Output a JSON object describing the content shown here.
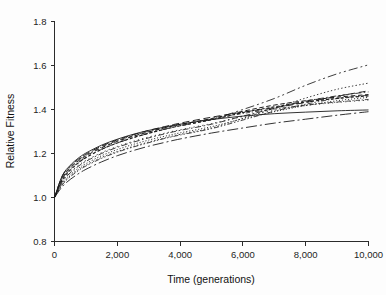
{
  "chart_data": {
    "type": "line",
    "title": "",
    "xlabel": "Time (generations)",
    "ylabel": "Relative Fitness",
    "xlim": [
      0,
      10000
    ],
    "ylim": [
      0.8,
      1.8
    ],
    "grid": false,
    "legend": "none",
    "xticks": [
      0,
      2000,
      4000,
      6000,
      8000,
      10000
    ],
    "xtick_labels": [
      "0",
      "2,000",
      "4,000",
      "6,000",
      "8,000",
      "10,000"
    ],
    "yticks": [
      0.8,
      1.0,
      1.2,
      1.4,
      1.6,
      1.8
    ],
    "ytick_labels": [
      "0.8",
      "1.0",
      "1.2",
      "1.4",
      "1.6",
      "1.8"
    ],
    "x": [
      0,
      250,
      500,
      750,
      1000,
      1500,
      2000,
      2500,
      3000,
      3500,
      4000,
      5000,
      6000,
      7000,
      8000,
      9000,
      10000
    ],
    "series": [
      {
        "name": "population-1",
        "style": "dashdotdot",
        "dash": "9,3,2,3,2,3",
        "width": 0.85,
        "values": [
          1.0,
          1.085,
          1.128,
          1.158,
          1.182,
          1.219,
          1.248,
          1.271,
          1.292,
          1.31,
          1.326,
          1.355,
          1.4,
          1.45,
          1.51,
          1.562,
          1.603
        ]
      },
      {
        "name": "population-2",
        "style": "dotted",
        "dash": "1.4,2.2",
        "width": 0.85,
        "values": [
          1.0,
          1.062,
          1.098,
          1.125,
          1.147,
          1.182,
          1.209,
          1.232,
          1.252,
          1.27,
          1.287,
          1.316,
          1.36,
          1.406,
          1.452,
          1.492,
          1.52
        ]
      },
      {
        "name": "population-3",
        "style": "dashed-long",
        "dash": "7,3.5",
        "width": 0.95,
        "values": [
          1.0,
          1.098,
          1.142,
          1.173,
          1.197,
          1.234,
          1.262,
          1.285,
          1.305,
          1.322,
          1.338,
          1.365,
          1.388,
          1.408,
          1.432,
          1.46,
          1.485
        ]
      },
      {
        "name": "population-4",
        "style": "dashdot",
        "dash": "6,2.5,1.6,2.5",
        "width": 0.85,
        "values": [
          1.0,
          1.072,
          1.112,
          1.141,
          1.164,
          1.2,
          1.228,
          1.251,
          1.271,
          1.289,
          1.305,
          1.333,
          1.37,
          1.405,
          1.438,
          1.462,
          1.48
        ]
      },
      {
        "name": "population-5",
        "style": "dashed",
        "dash": "4.5,2.6",
        "width": 1.0,
        "values": [
          1.0,
          1.09,
          1.134,
          1.165,
          1.189,
          1.226,
          1.255,
          1.278,
          1.298,
          1.316,
          1.332,
          1.359,
          1.392,
          1.42,
          1.44,
          1.456,
          1.468
        ]
      },
      {
        "name": "population-6",
        "style": "dashdotdot-fine",
        "dash": "5,2,1.4,2,1.4,2",
        "width": 0.8,
        "values": [
          1.0,
          1.058,
          1.094,
          1.121,
          1.143,
          1.178,
          1.206,
          1.229,
          1.249,
          1.268,
          1.284,
          1.313,
          1.352,
          1.392,
          1.424,
          1.45,
          1.465
        ]
      },
      {
        "name": "population-7",
        "style": "dashed-short",
        "dash": "3,2",
        "width": 1.1,
        "values": [
          1.0,
          1.08,
          1.124,
          1.156,
          1.181,
          1.219,
          1.248,
          1.272,
          1.292,
          1.31,
          1.326,
          1.353,
          1.386,
          1.412,
          1.434,
          1.45,
          1.462
        ]
      },
      {
        "name": "population-8",
        "style": "dotted-fine",
        "dash": "1.1,1.9",
        "width": 0.9,
        "values": [
          1.0,
          1.066,
          1.104,
          1.132,
          1.154,
          1.19,
          1.218,
          1.241,
          1.261,
          1.278,
          1.294,
          1.322,
          1.358,
          1.39,
          1.418,
          1.44,
          1.455
        ]
      },
      {
        "name": "population-9",
        "style": "solid",
        "dash": "",
        "width": 0.9,
        "values": [
          1.0,
          1.1,
          1.146,
          1.178,
          1.202,
          1.238,
          1.265,
          1.287,
          1.305,
          1.32,
          1.333,
          1.354,
          1.37,
          1.381,
          1.388,
          1.394,
          1.398
        ]
      },
      {
        "name": "population-10",
        "style": "dashdot-long",
        "dash": "11,3,2,3",
        "width": 0.9,
        "values": [
          1.0,
          1.05,
          1.082,
          1.107,
          1.128,
          1.162,
          1.19,
          1.213,
          1.233,
          1.25,
          1.266,
          1.293,
          1.316,
          1.338,
          1.356,
          1.374,
          1.39
        ]
      },
      {
        "name": "population-11",
        "style": "dotted-sparse",
        "dash": "1.2,3.2",
        "width": 0.85,
        "values": [
          1.0,
          1.074,
          1.115,
          1.145,
          1.168,
          1.204,
          1.232,
          1.255,
          1.275,
          1.292,
          1.308,
          1.336,
          1.368,
          1.396,
          1.418,
          1.432,
          1.443
        ]
      },
      {
        "name": "population-12",
        "style": "dashdot-fine",
        "dash": "4,2,1.2,2",
        "width": 0.8,
        "values": [
          1.0,
          1.094,
          1.138,
          1.169,
          1.193,
          1.23,
          1.258,
          1.281,
          1.3,
          1.317,
          1.332,
          1.357,
          1.382,
          1.402,
          1.42,
          1.434,
          1.446
        ]
      }
    ]
  },
  "axes": {
    "ylabel": "Relative Fitness",
    "xlabel": "Time (generations)"
  }
}
